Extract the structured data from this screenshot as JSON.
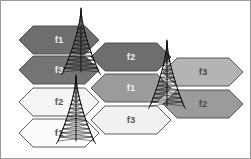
{
  "figure": {
    "width": 251,
    "height": 159,
    "background": "#ffffff",
    "border_color": "#9a9a9a",
    "cell_outline_color": "#4a4a4a",
    "gap_color": "#ffffff"
  },
  "palette": {
    "dark": "#6e6e6e",
    "dark_alt": "#757575",
    "medium": "#9b9b9b",
    "medium_light": "#b4b4b4",
    "light": "#f1f1f1",
    "lighter": "#fbfbfb",
    "label_dark_on_dark": "#efefef",
    "label_dark_on_light": "#555555"
  },
  "legend_groups": [
    {
      "name": "tier-dark",
      "description": "dark shaded cells",
      "color": "#6e6e6e"
    },
    {
      "name": "tier-medium",
      "description": "medium shaded cells",
      "color": "#9b9b9b"
    },
    {
      "name": "tier-light",
      "description": "light shaded cells",
      "color": "#f1f1f1"
    }
  ],
  "cells": [
    {
      "id": "cell-f1-top-left",
      "label": "f1",
      "frequency": "f1",
      "tier": "dark",
      "fill": "#6e6e6e",
      "label_color": "#efefef",
      "center": {
        "x": 59,
        "y": 40
      },
      "points": "19,40 33,26 85,26 99,40 85,54 33,54"
    },
    {
      "id": "cell-f3-left",
      "label": "f3",
      "frequency": "f3",
      "tier": "dark",
      "fill": "#757575",
      "label_color": "#efefef",
      "center": {
        "x": 59,
        "y": 70
      },
      "points": "19,70 33,56 85,56 99,70 85,84 33,84"
    },
    {
      "id": "cell-f2-center-top",
      "label": "f2",
      "frequency": "f2",
      "tier": "dark",
      "fill": "#6e6e6e",
      "label_color": "#efefef",
      "center": {
        "x": 131,
        "y": 57
      },
      "points": "91,57 105,43 157,43 171,57 157,71 105,71"
    },
    {
      "id": "cell-f1-center",
      "label": "f1",
      "frequency": "f1",
      "tier": "medium",
      "fill": "#9b9b9b",
      "label_color": "#efefef",
      "center": {
        "x": 131,
        "y": 88
      },
      "points": "91,88 105,74 157,74 171,88 157,102 105,102"
    },
    {
      "id": "cell-f3-right",
      "label": "f3",
      "frequency": "f3",
      "tier": "medium-light",
      "fill": "#b4b4b4",
      "label_color": "#4a4a4a",
      "center": {
        "x": 203,
        "y": 72
      },
      "points": "163,72 177,58 229,58 243,72 229,86 177,86"
    },
    {
      "id": "cell-f2-right",
      "label": "f2",
      "frequency": "f2",
      "tier": "medium",
      "fill": "#9b9b9b",
      "label_color": "#4a4a4a",
      "center": {
        "x": 203,
        "y": 104
      },
      "points": "163,104 177,90 229,90 243,104 229,118 177,118"
    },
    {
      "id": "cell-f2-lower-left",
      "label": "f2",
      "frequency": "f2",
      "tier": "light",
      "fill": "#f4f4f4",
      "label_color": "#555555",
      "center": {
        "x": 59,
        "y": 102
      },
      "points": "19,102 33,88 85,88 99,102 85,116 33,116"
    },
    {
      "id": "cell-f1-bottom-left",
      "label": "f1",
      "frequency": "f1",
      "tier": "lighter",
      "fill": "#fbfbfb",
      "label_color": "#555555",
      "center": {
        "x": 59,
        "y": 133
      },
      "points": "19,133 33,119 85,119 99,133 85,147 33,147"
    },
    {
      "id": "cell-f3-bottom-center",
      "label": "f3",
      "frequency": "f3",
      "tier": "light",
      "fill": "#f1f1f1",
      "label_color": "#555555",
      "center": {
        "x": 131,
        "y": 120
      },
      "points": "91,120 105,106 157,106 171,120 157,134 105,134"
    }
  ],
  "towers": [
    {
      "id": "tower-top",
      "name": "base-station-tower-1",
      "apex": {
        "x": 81,
        "y": 9
      },
      "base_y": 72,
      "half_width": 18
    },
    {
      "id": "tower-middle",
      "name": "base-station-tower-2",
      "apex": {
        "x": 76,
        "y": 76
      },
      "base_y": 141,
      "half_width": 18
    },
    {
      "id": "tower-right",
      "name": "base-station-tower-3",
      "apex": {
        "x": 167,
        "y": 41
      },
      "base_y": 106,
      "half_width": 17
    }
  ]
}
